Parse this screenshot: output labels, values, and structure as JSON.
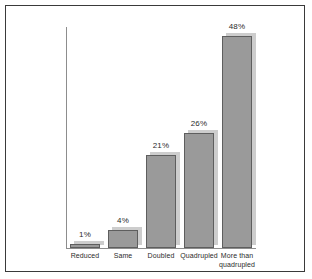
{
  "chart_data": {
    "type": "bar",
    "title": "",
    "subtitle": "",
    "xlabel": "",
    "ylabel": "",
    "ylim": [
      0,
      50
    ],
    "grid": false,
    "legend": false,
    "axis_visible": {
      "x": true,
      "y": true
    },
    "tick_labels": {
      "y": []
    },
    "categories": [
      "Reduced",
      "Same",
      "Doubled",
      "Quadrupled",
      "More than quadrupled"
    ],
    "category_lines": [
      [
        "Reduced"
      ],
      [
        "Same"
      ],
      [
        "Doubled"
      ],
      [
        "Quadrupled"
      ],
      [
        "More than",
        "quadrupled"
      ]
    ],
    "values": [
      1,
      4,
      21,
      26,
      48
    ],
    "data_labels": [
      "1%",
      "4%",
      "21%",
      "26%",
      "48%"
    ],
    "colors": {
      "bar_fill": "#9a9a9a",
      "bar_border": "#5e5e5e",
      "bar_shadow": "#cdcdcd",
      "axis": "#8d8d8d",
      "frame": "#3a3a3a",
      "text": "#2b2b2b",
      "background": "#ffffff"
    }
  }
}
